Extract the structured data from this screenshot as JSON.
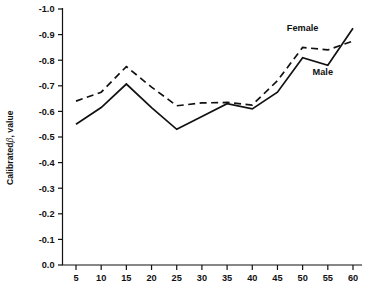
{
  "chart_data": {
    "type": "line",
    "title": "",
    "subtitle": "",
    "xlabel": "",
    "ylabel": "Calibrated β , value",
    "ylabel_prefix": "Calibrated",
    "ylabel_symbol": "β",
    "ylabel_suffix": ", value",
    "x": [
      5,
      10,
      15,
      20,
      25,
      30,
      35,
      40,
      45,
      50,
      55,
      60
    ],
    "xtick_labels": [
      "5",
      "10",
      "15",
      "20",
      "25",
      "30",
      "35",
      "40",
      "45",
      "50",
      "55",
      "60"
    ],
    "ytick_labels": [
      "-1.0",
      "-0.9",
      "-0.8",
      "-0.7",
      "-0.6",
      "-0.5",
      "-0.4",
      "-0.3",
      "-0.2",
      "-0.1",
      "0.0"
    ],
    "ytick_values": [
      -1.0,
      -0.9,
      -0.8,
      -0.7,
      -0.6,
      -0.5,
      -0.4,
      -0.3,
      -0.2,
      -0.1,
      0.0
    ],
    "ylim": [
      0.0,
      -1.0
    ],
    "xlim": [
      5,
      60
    ],
    "grid": false,
    "legend_position": "inline-annotations",
    "series": [
      {
        "name": "Female",
        "style": "dashed",
        "color": "#111111",
        "label_x": 50,
        "label_y": -0.915,
        "values": [
          -0.64,
          -0.675,
          -0.775,
          -0.695,
          -0.622,
          -0.633,
          -0.635,
          -0.625,
          -0.72,
          -0.85,
          -0.84,
          -0.875
        ]
      },
      {
        "name": "Male",
        "style": "solid",
        "color": "#111111",
        "label_x": 54,
        "label_y": -0.742,
        "values": [
          -0.55,
          -0.615,
          -0.707,
          -0.615,
          -0.53,
          -0.58,
          -0.63,
          -0.61,
          -0.675,
          -0.81,
          -0.78,
          -0.925
        ]
      }
    ],
    "annotations": [
      {
        "text": "Female",
        "x": 50,
        "y": -0.915
      },
      {
        "text": "Male",
        "x": 54,
        "y": -0.742
      }
    ]
  }
}
